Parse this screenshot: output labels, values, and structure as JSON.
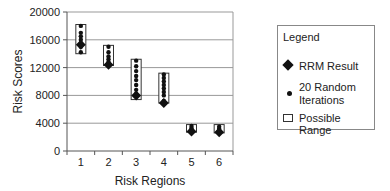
{
  "chart_data": {
    "type": "scatter",
    "title": "",
    "xlabel": "Risk Regions",
    "ylabel": "Risk Scores",
    "ylim": [
      0,
      20000
    ],
    "yticks": [
      0,
      4000,
      8000,
      12000,
      16000,
      20000
    ],
    "categories": [
      "1",
      "2",
      "3",
      "4",
      "5",
      "6"
    ],
    "grid": true,
    "legend_position": "right",
    "series": [
      {
        "name": "RRM Result",
        "marker": "diamond",
        "values": [
          15300,
          12400,
          8000,
          6900,
          2800,
          2700
        ]
      },
      {
        "name": "20 Random Iterations",
        "marker": "dot",
        "values": [
          [
            14200,
            15000,
            15500,
            16000,
            16500,
            17000,
            18000
          ],
          [
            12500,
            12800,
            13200,
            13600,
            14200,
            15000
          ],
          [
            8200,
            8800,
            9500,
            10200,
            10800,
            11500,
            12200,
            13000
          ],
          [
            7200,
            8000,
            8500,
            9000,
            9500,
            10000,
            10500,
            11000
          ],
          [
            2900,
            3100,
            3300,
            3600
          ],
          [
            2800,
            3000,
            3200,
            3500
          ]
        ]
      },
      {
        "name": "Possible Range",
        "marker": "rect",
        "ranges": [
          [
            14000,
            18200
          ],
          [
            12300,
            15200
          ],
          [
            7400,
            13200
          ],
          [
            6900,
            11200
          ],
          [
            2700,
            3800
          ],
          [
            2600,
            3800
          ]
        ]
      }
    ]
  },
  "legend": {
    "title": "Legend",
    "items": [
      {
        "label": "RRM Result"
      },
      {
        "label": "20 Random Iterations"
      },
      {
        "label": "Possible Range"
      }
    ]
  },
  "axes": {
    "xlabel": "Risk Regions",
    "ylabel": "Risk Scores",
    "yticks": [
      "20000",
      "16000",
      "12000",
      "8000",
      "4000",
      "0"
    ],
    "xticks": [
      "1",
      "2",
      "3",
      "4",
      "5",
      "6"
    ]
  }
}
